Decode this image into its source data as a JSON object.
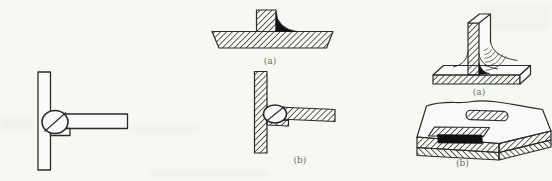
{
  "document": {
    "kind": "scanned-technical-figure",
    "topic": "weld and plug joint diagrams",
    "background_color": "#f7f7f4",
    "line_color": "#2b2b2b",
    "weld_fill_color": "#101010",
    "caption_color": "#6a6a6a"
  },
  "figures": {
    "left_outline": {
      "description": "tee joint with plug outline, no caption"
    },
    "middle_section_a": {
      "caption": "(a)"
    },
    "middle_section_b": {
      "caption": "(b)"
    },
    "right_perspective_a": {
      "caption": "(a)"
    },
    "right_perspective_b": {
      "caption": "(b)"
    }
  }
}
